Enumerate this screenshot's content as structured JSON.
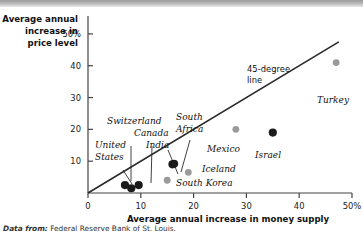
{
  "caption": {
    "lead": "Data from:",
    "text": "Federal Reserve Bank of St. Louis."
  },
  "chart_data": {
    "type": "scatter",
    "title": "",
    "xlabel": "Average annual increase in money supply",
    "ylabel": "Average annual increase in price level",
    "ylabel_lines": [
      "Average annual",
      "increase in",
      "price level"
    ],
    "xlim": [
      0,
      50
    ],
    "ylim": [
      0,
      55
    ],
    "xticks": [
      0,
      10,
      20,
      30,
      40,
      50
    ],
    "xtick_labels": [
      "0",
      "10",
      "20",
      "30",
      "40",
      "50%"
    ],
    "yticks": [
      10,
      20,
      30,
      40,
      50
    ],
    "ytick_labels": [
      "10",
      "20",
      "30",
      "40",
      "50%"
    ],
    "grid": false,
    "legend": "none",
    "colors": {
      "on_line": "#1a1a1a",
      "off_line": "#9a9a9a",
      "line": "#2a2a2a",
      "axis": "#444444"
    },
    "reference_line": {
      "label_lines": [
        "45-degree",
        "line"
      ],
      "from": [
        0,
        0
      ],
      "to": [
        50,
        50
      ],
      "slope": 1
    },
    "points": [
      {
        "name": "United States",
        "x": 7.0,
        "y": 2.5,
        "marker": "on_line",
        "label_pos": "upper-left"
      },
      {
        "name": "Switzerland",
        "x": 8.2,
        "y": 1.5,
        "marker": "on_line",
        "label_pos": "above"
      },
      {
        "name": "Canada",
        "x": 9.6,
        "y": 2.5,
        "marker": "on_line",
        "label_pos": "above"
      },
      {
        "name": "India",
        "x": 16.0,
        "y": 9.0,
        "marker": "on_line",
        "label_pos": "above-left"
      },
      {
        "name": "South Africa",
        "x": 16.3,
        "y": 9.2,
        "marker": "on_line",
        "label_pos": "above-right"
      },
      {
        "name": "South Korea",
        "x": 15.0,
        "y": 4.0,
        "marker": "off_line",
        "label_pos": "right"
      },
      {
        "name": "Iceland",
        "x": 19.0,
        "y": 6.5,
        "marker": "off_line",
        "label_pos": "right"
      },
      {
        "name": "Mexico",
        "x": 28.0,
        "y": 20.0,
        "marker": "off_line",
        "label_pos": "below"
      },
      {
        "name": "Israel",
        "x": 35.0,
        "y": 19.0,
        "marker": "on_line",
        "label_pos": "below"
      },
      {
        "name": "Turkey",
        "x": 47.0,
        "y": 41.0,
        "marker": "off_line",
        "label_pos": "below"
      }
    ]
  }
}
